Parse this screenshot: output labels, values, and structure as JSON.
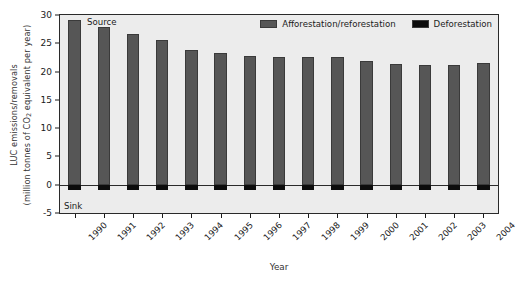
{
  "chart_data": {
    "type": "bar",
    "title": "",
    "subtitle": "",
    "xlabel": "Year",
    "ylabel": "LUC emissions/removals (million tonnes of CO2 equivalent per year)",
    "ylabel_line1": "LUC emissions/removals",
    "ylabel_line2_pre": "(million tonnes of CO",
    "ylabel_line2_sub": "2",
    "ylabel_line2_post": " equivalent per year)",
    "categories": [
      "1990",
      "1991",
      "1992",
      "1993",
      "1994",
      "1995",
      "1996",
      "1997",
      "1998",
      "1999",
      "2000",
      "2001",
      "2002",
      "2003",
      "2004"
    ],
    "series": [
      {
        "name": "Afforestation/reforestation",
        "color": "#565656",
        "values": [
          29.2,
          27.9,
          26.6,
          25.5,
          23.8,
          23.2,
          22.8,
          22.6,
          22.6,
          22.6,
          21.8,
          21.3,
          21.1,
          21.2,
          21.6
        ]
      },
      {
        "name": "Deforestation",
        "color": "#0c0c0c",
        "values": [
          -1.0,
          -1.0,
          -1.0,
          -1.0,
          -1.0,
          -1.0,
          -1.0,
          -1.0,
          -1.0,
          -1.0,
          -1.0,
          -1.0,
          -1.0,
          -1.0,
          -1.0
        ]
      }
    ],
    "ylim": [
      -5,
      30
    ],
    "yticks": [
      30,
      25,
      20,
      15,
      10,
      5,
      0,
      -5
    ],
    "ytick_labels": [
      "30",
      "25",
      "20",
      "15",
      "10",
      "5",
      "0",
      "-5"
    ],
    "grid": false,
    "legend_position": "top-right",
    "annotations": [
      {
        "text": "Source",
        "position": "top-left-inside"
      },
      {
        "text": "Sink",
        "position": "bottom-left-inside"
      }
    ],
    "plot_background": "#ececec",
    "zero_line_color": "#2a2a2a"
  },
  "legend": {
    "items": [
      {
        "label": "Afforestation/reforestation",
        "color": "#565656"
      },
      {
        "label": "Deforestation",
        "color": "#0c0c0c"
      }
    ]
  },
  "annotations": {
    "source": "Source",
    "sink": "Sink"
  }
}
